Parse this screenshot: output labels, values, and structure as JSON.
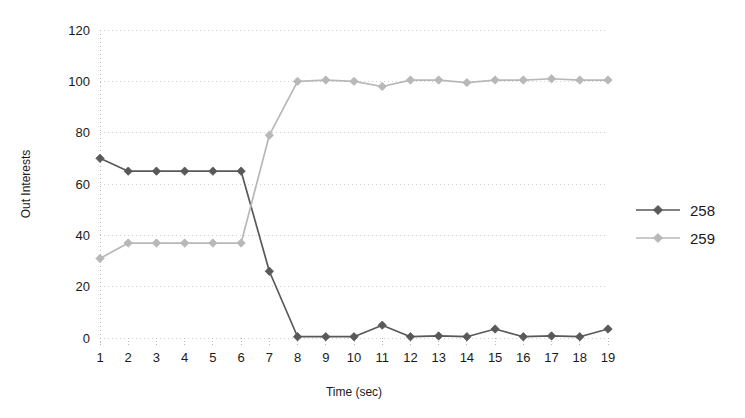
{
  "chart_data": {
    "type": "line",
    "title": "",
    "subtitle": "",
    "xlabel": "Time (sec)",
    "ylabel": "Out Interests",
    "x": [
      1,
      2,
      3,
      4,
      5,
      6,
      7,
      8,
      9,
      10,
      11,
      12,
      13,
      14,
      15,
      16,
      17,
      18,
      19
    ],
    "xtick_labels": [
      "1",
      "2",
      "3",
      "4",
      "5",
      "6",
      "7",
      "8",
      "9",
      "10",
      "11",
      "12",
      "13",
      "14",
      "15",
      "16",
      "17",
      "18",
      "19"
    ],
    "ytick_labels": [
      "0",
      "20",
      "40",
      "60",
      "80",
      "100",
      "120"
    ],
    "yticks": [
      0,
      20,
      40,
      60,
      80,
      100,
      120
    ],
    "xlim": [
      1,
      19
    ],
    "ylim": [
      0,
      120
    ],
    "grid": true,
    "grid_style": "dotted",
    "legend_position": "right",
    "marker": "diamond",
    "series": [
      {
        "name": "258",
        "color": "#595959",
        "values": [
          70,
          65,
          65,
          65,
          65,
          65,
          26,
          0.5,
          0.5,
          0.5,
          5,
          0.5,
          0.8,
          0.5,
          3.5,
          0.5,
          0.8,
          0.5,
          3.5
        ]
      },
      {
        "name": "259",
        "color": "#b8b8b8",
        "values": [
          31,
          37,
          37,
          37,
          37,
          37,
          79,
          100,
          100.5,
          100,
          98,
          100.5,
          100.5,
          99.5,
          100.5,
          100.5,
          101,
          100.5,
          100.5
        ]
      }
    ]
  },
  "legend": {
    "entries": [
      {
        "label": "258",
        "color": "#595959"
      },
      {
        "label": "259",
        "color": "#b8b8b8"
      }
    ]
  },
  "axes": {
    "x_title": "Time (sec)",
    "y_title": "Out Interests"
  },
  "colors": {
    "background": "#ffffff",
    "grid": "#cfcfcf",
    "axis": "#b5b5b5",
    "text": "#1a1a1a",
    "series_258": "#595959",
    "series_259": "#b8b8b8"
  }
}
